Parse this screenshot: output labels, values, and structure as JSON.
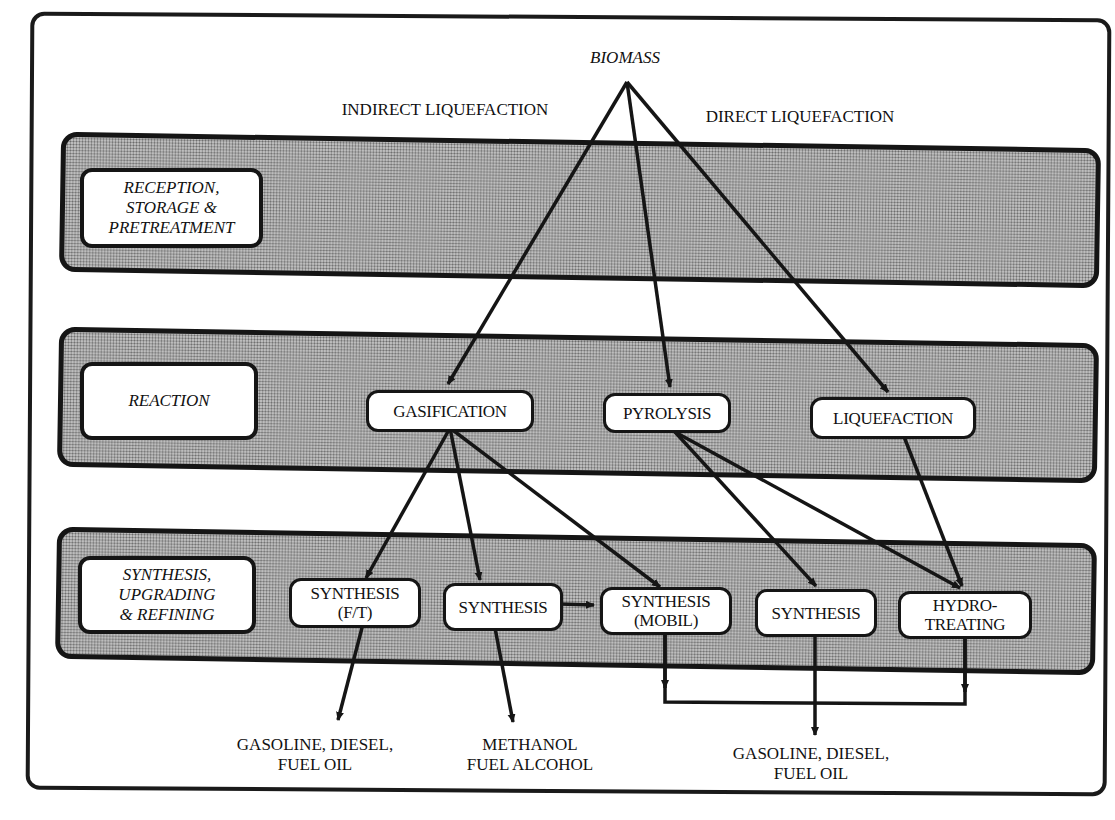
{
  "diagram": {
    "source": {
      "label": "BIOMASS"
    },
    "routes": {
      "indirect": "INDIRECT LIQUEFACTION",
      "direct": "DIRECT LIQUEFACTION"
    },
    "stages": [
      {
        "id": "reception",
        "label": "RECEPTION,\nSTORAGE &\nPRETREATMENT"
      },
      {
        "id": "reaction",
        "label": "REACTION"
      },
      {
        "id": "synthesis",
        "label": "SYNTHESIS,\nUPGRADING\n& REFINING"
      }
    ],
    "nodes": {
      "reaction": [
        {
          "id": "gasification",
          "label": "GASIFICATION"
        },
        {
          "id": "pyrolysis",
          "label": "PYROLYSIS"
        },
        {
          "id": "liquefaction",
          "label": "LIQUEFACTION"
        }
      ],
      "synthesis": [
        {
          "id": "synthesis_ft",
          "label": "SYNTHESIS\n(F/T)"
        },
        {
          "id": "synthesis_methanol",
          "label": "SYNTHESIS"
        },
        {
          "id": "synthesis_mobil",
          "label": "SYNTHESIS\n(MOBIL)"
        },
        {
          "id": "synthesis_pyro",
          "label": "SYNTHESIS"
        },
        {
          "id": "hydrotreating",
          "label": "HYDRO-\nTREATING"
        }
      ]
    },
    "products": [
      {
        "id": "product_ft",
        "label": "GASOLINE, DIESEL,\nFUEL OIL"
      },
      {
        "id": "product_methanol",
        "label": "METHANOL\nFUEL ALCOHOL"
      },
      {
        "id": "product_combined",
        "label": "GASOLINE, DIESEL,\nFUEL OIL"
      }
    ],
    "edges": [
      [
        "biomass",
        "gasification"
      ],
      [
        "biomass",
        "pyrolysis"
      ],
      [
        "biomass",
        "liquefaction"
      ],
      [
        "gasification",
        "synthesis_ft"
      ],
      [
        "gasification",
        "synthesis_methanol"
      ],
      [
        "gasification",
        "synthesis_mobil"
      ],
      [
        "pyrolysis",
        "synthesis_pyro"
      ],
      [
        "pyrolysis",
        "hydrotreating"
      ],
      [
        "liquefaction",
        "hydrotreating"
      ],
      [
        "synthesis_methanol",
        "synthesis_mobil"
      ],
      [
        "synthesis_ft",
        "product_ft"
      ],
      [
        "synthesis_methanol",
        "product_methanol"
      ],
      [
        "synthesis_mobil",
        "product_combined"
      ],
      [
        "synthesis_pyro",
        "product_combined"
      ],
      [
        "hydrotreating",
        "product_combined"
      ]
    ],
    "colors": {
      "ink": "#151515",
      "band_fill": "#bdbdbd",
      "box_fill": "#ffffff"
    }
  }
}
